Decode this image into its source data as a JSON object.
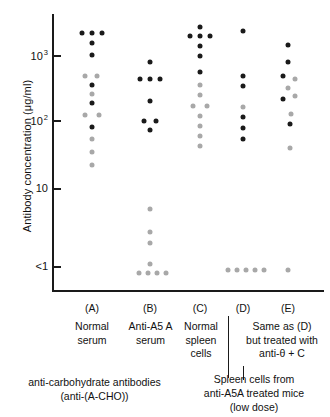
{
  "chart_data": {
    "type": "scatter",
    "title": "",
    "ylabel": "Antibody concentration (μg/ml)",
    "xlabel": "",
    "yscale": "log",
    "ylim": [
      0.6,
      4000
    ],
    "grid": false,
    "legend": "none",
    "y_ticks": [
      {
        "label": "10",
        "sup": "3",
        "value": 1000,
        "y": 55
      },
      {
        "label": "10",
        "sup": "2",
        "value": 100,
        "y": 120
      },
      {
        "label": "10",
        "sup": "",
        "value": 10,
        "y": 188
      },
      {
        "label": "<1",
        "sup": "",
        "value": 0.7,
        "y": 266
      }
    ],
    "series": [
      {
        "name": "black-dot",
        "color": "#1a1a1a",
        "description": "anti-A5A antibody"
      },
      {
        "name": "gray-dot",
        "color": "#a8a8a8",
        "description": "anti-carbohydrate antibodies (anti-(A-CHO))"
      }
    ],
    "categories": [
      "(A)",
      "(B)",
      "(C)",
      "(D)",
      "(E)"
    ],
    "groups": [
      {
        "key": "(A)",
        "label": "Normal\nserum",
        "center_x": 92,
        "points": [
          {
            "x": 82,
            "y": 33,
            "series": "black-dot"
          },
          {
            "x": 92,
            "y": 33,
            "series": "black-dot"
          },
          {
            "x": 102,
            "y": 33,
            "series": "black-dot"
          },
          {
            "x": 92,
            "y": 43,
            "series": "black-dot"
          },
          {
            "x": 92,
            "y": 55,
            "series": "black-dot"
          },
          {
            "x": 85,
            "y": 76,
            "series": "gray-dot"
          },
          {
            "x": 97,
            "y": 76,
            "series": "gray-dot"
          },
          {
            "x": 92,
            "y": 85,
            "series": "black-dot"
          },
          {
            "x": 92,
            "y": 94,
            "series": "gray-dot"
          },
          {
            "x": 92,
            "y": 103,
            "series": "black-dot"
          },
          {
            "x": 85,
            "y": 115,
            "series": "gray-dot"
          },
          {
            "x": 99,
            "y": 115,
            "series": "gray-dot"
          },
          {
            "x": 92,
            "y": 127,
            "series": "black-dot"
          },
          {
            "x": 92,
            "y": 139,
            "series": "gray-dot"
          },
          {
            "x": 92,
            "y": 152,
            "series": "gray-dot"
          },
          {
            "x": 92,
            "y": 165,
            "series": "gray-dot"
          }
        ]
      },
      {
        "key": "(B)",
        "label": "Anti-A5 A\nserum",
        "center_x": 150,
        "points": [
          {
            "x": 150,
            "y": 62,
            "series": "black-dot"
          },
          {
            "x": 140,
            "y": 79,
            "series": "black-dot"
          },
          {
            "x": 150,
            "y": 79,
            "series": "black-dot"
          },
          {
            "x": 160,
            "y": 79,
            "series": "black-dot"
          },
          {
            "x": 150,
            "y": 101,
            "series": "black-dot"
          },
          {
            "x": 144,
            "y": 121,
            "series": "black-dot"
          },
          {
            "x": 156,
            "y": 121,
            "series": "black-dot"
          },
          {
            "x": 150,
            "y": 130,
            "series": "black-dot"
          },
          {
            "x": 150,
            "y": 209,
            "series": "gray-dot"
          },
          {
            "x": 150,
            "y": 232,
            "series": "gray-dot"
          },
          {
            "x": 150,
            "y": 243,
            "series": "gray-dot"
          },
          {
            "x": 150,
            "y": 264,
            "series": "gray-dot"
          },
          {
            "x": 139,
            "y": 273,
            "series": "gray-dot"
          },
          {
            "x": 148,
            "y": 273,
            "series": "gray-dot"
          },
          {
            "x": 157,
            "y": 273,
            "series": "gray-dot"
          },
          {
            "x": 166,
            "y": 273,
            "series": "gray-dot"
          }
        ]
      },
      {
        "key": "(C)",
        "label": "Normal\nspleen\ncells",
        "center_x": 200,
        "points": [
          {
            "x": 200,
            "y": 27,
            "series": "black-dot"
          },
          {
            "x": 190,
            "y": 36,
            "series": "black-dot"
          },
          {
            "x": 200,
            "y": 36,
            "series": "black-dot"
          },
          {
            "x": 210,
            "y": 36,
            "series": "black-dot"
          },
          {
            "x": 200,
            "y": 46,
            "series": "black-dot"
          },
          {
            "x": 200,
            "y": 56,
            "series": "black-dot"
          },
          {
            "x": 200,
            "y": 72,
            "series": "black-dot"
          },
          {
            "x": 200,
            "y": 85,
            "series": "gray-dot"
          },
          {
            "x": 200,
            "y": 95,
            "series": "gray-dot"
          },
          {
            "x": 193,
            "y": 106,
            "series": "gray-dot"
          },
          {
            "x": 207,
            "y": 106,
            "series": "gray-dot"
          },
          {
            "x": 200,
            "y": 116,
            "series": "gray-dot"
          },
          {
            "x": 200,
            "y": 126,
            "series": "gray-dot"
          },
          {
            "x": 200,
            "y": 136,
            "series": "gray-dot"
          },
          {
            "x": 200,
            "y": 146,
            "series": "gray-dot"
          }
        ]
      },
      {
        "key": "(D)",
        "label": "",
        "center_x": 243,
        "points": [
          {
            "x": 243,
            "y": 31,
            "series": "black-dot"
          },
          {
            "x": 243,
            "y": 76,
            "series": "black-dot"
          },
          {
            "x": 243,
            "y": 86,
            "series": "black-dot"
          },
          {
            "x": 243,
            "y": 107,
            "series": "gray-dot"
          },
          {
            "x": 243,
            "y": 117,
            "series": "black-dot"
          },
          {
            "x": 243,
            "y": 128,
            "series": "black-dot"
          },
          {
            "x": 243,
            "y": 139,
            "series": "black-dot"
          },
          {
            "x": 228,
            "y": 270,
            "series": "gray-dot"
          },
          {
            "x": 237,
            "y": 270,
            "series": "gray-dot"
          },
          {
            "x": 246,
            "y": 270,
            "series": "gray-dot"
          },
          {
            "x": 255,
            "y": 270,
            "series": "gray-dot"
          },
          {
            "x": 264,
            "y": 270,
            "series": "gray-dot"
          }
        ]
      },
      {
        "key": "(E)",
        "label": "Same as (D)\nbut treated with\nanti-θ + C",
        "center_x": 288,
        "points": [
          {
            "x": 288,
            "y": 45,
            "series": "black-dot"
          },
          {
            "x": 288,
            "y": 62,
            "series": "black-dot"
          },
          {
            "x": 283,
            "y": 76,
            "series": "black-dot"
          },
          {
            "x": 295,
            "y": 79,
            "series": "gray-dot"
          },
          {
            "x": 288,
            "y": 88,
            "series": "gray-dot"
          },
          {
            "x": 295,
            "y": 96,
            "series": "gray-dot"
          },
          {
            "x": 283,
            "y": 99,
            "series": "black-dot"
          },
          {
            "x": 291,
            "y": 114,
            "series": "gray-dot"
          },
          {
            "x": 290,
            "y": 124,
            "series": "black-dot"
          },
          {
            "x": 290,
            "y": 148,
            "series": "gray-dot"
          },
          {
            "x": 288,
            "y": 270,
            "series": "gray-dot"
          }
        ]
      }
    ]
  },
  "axis": {
    "y_title": "Antibody concentration (μg/ml)"
  },
  "columns": {
    "a": {
      "key": "(A)",
      "label": "Normal\nserum"
    },
    "b": {
      "key": "(B)",
      "label": "Anti-A5 A\nserum"
    },
    "c": {
      "key": "(C)",
      "label": "Normal\nspleen\ncells"
    },
    "d": {
      "key": "(D)",
      "label": ""
    },
    "e": {
      "key": "(E)",
      "label": "Same as (D)\nbut treated with\nanti-θ + C"
    }
  },
  "footnotes": {
    "left": "anti-carbohydrate antibodies\n(anti-(A-CHO))",
    "right": "Spleen cells from\nanti-A5A treated mice\n(low dose)"
  }
}
